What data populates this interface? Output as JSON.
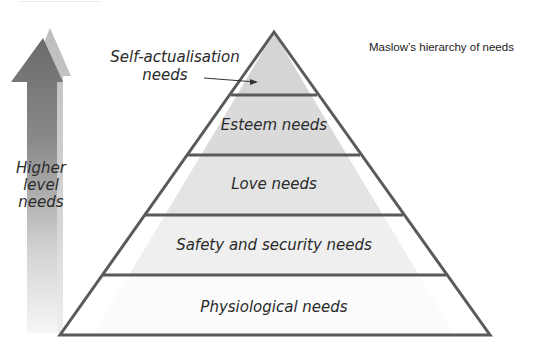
{
  "title": "Maslow’s hierarchy of needs",
  "top_caption": "—————————",
  "side_arrow": {
    "label_lines": [
      "Higher",
      "level",
      "needs"
    ],
    "color_dark": "#6a6a6a",
    "color_light": "#c4c4c4"
  },
  "pyramid": {
    "stroke": "#5a5a5a",
    "levels": [
      {
        "label": "Self-actualisation needs",
        "callout_lines": [
          "Self-actualisation",
          "needs"
        ],
        "fill": "#d5d5d5"
      },
      {
        "label": "Esteem needs",
        "fill": "#dadada"
      },
      {
        "label": "Love needs",
        "fill": "#e4e4e4"
      },
      {
        "label": "Safety and security needs",
        "fill": "#efefef"
      },
      {
        "label": "Physiological needs",
        "fill": "#fbfbfb"
      }
    ]
  }
}
